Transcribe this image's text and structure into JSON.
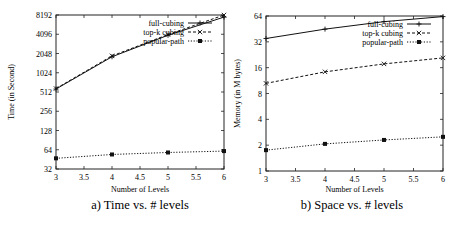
{
  "chart_data": [
    {
      "type": "line",
      "title": "",
      "caption": "a) Time vs. # levels",
      "xlabel": "Number of Levels",
      "ylabel": "Time (in Second)",
      "yscale": "log2",
      "xlim": [
        3,
        6
      ],
      "ylim": [
        32,
        8192
      ],
      "xticks": [
        "3",
        "3.5",
        "4",
        "4.5",
        "5",
        "5.5",
        "6"
      ],
      "yticks": [
        "32",
        "64",
        "128",
        "256",
        "512",
        "1024",
        "2048",
        "4096",
        "8192"
      ],
      "legend_position": "top-right",
      "grid": false,
      "x": [
        3,
        4,
        5,
        6
      ],
      "series": [
        {
          "name": "full-cubing",
          "values": [
            570,
            1820,
            3950,
            7600
          ],
          "style": "solid",
          "marker": "+"
        },
        {
          "name": "top-k cubing",
          "values": [
            580,
            1880,
            4050,
            8192
          ],
          "style": "dashed",
          "marker": "x"
        },
        {
          "name": "popular-path",
          "values": [
            47,
            54,
            58,
            61
          ],
          "style": "dotted",
          "marker": "square"
        }
      ]
    },
    {
      "type": "line",
      "title": "",
      "caption": "b) Space vs. # levels",
      "xlabel": "Number of Levels",
      "ylabel": "Memory (in M bytes)",
      "yscale": "log2",
      "xlim": [
        3,
        6
      ],
      "ylim": [
        1,
        64
      ],
      "xticks": [
        "3",
        "3.5",
        "4",
        "4.5",
        "5",
        "5.5",
        "6"
      ],
      "yticks": [
        "1",
        "2",
        "4",
        "8",
        "16",
        "32",
        "64"
      ],
      "legend_position": "top-right",
      "grid": false,
      "x": [
        3,
        4,
        5,
        6
      ],
      "series": [
        {
          "name": "full-cubing",
          "values": [
            35,
            45,
            55,
            63
          ],
          "style": "solid",
          "marker": "+"
        },
        {
          "name": "top-k cubing",
          "values": [
            10.5,
            14.3,
            17.7,
            20.8
          ],
          "style": "dashed",
          "marker": "x"
        },
        {
          "name": "popular-path",
          "values": [
            1.75,
            2.07,
            2.3,
            2.5
          ],
          "style": "dotted",
          "marker": "square"
        }
      ]
    }
  ]
}
